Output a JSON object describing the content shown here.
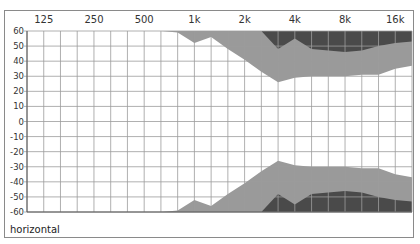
{
  "chart_data": {
    "type": "area",
    "title": "",
    "label": "horizontal",
    "xlabel": "Frequency (Hz)",
    "ylabel": "Angle (degrees)",
    "x_tick_labels": [
      "125",
      "250",
      "500",
      "1k",
      "2k",
      "4k",
      "8k",
      "16k"
    ],
    "y_tick_labels": [
      "60",
      "50",
      "40",
      "30",
      "20",
      "10",
      "0",
      "-10",
      "-20",
      "-30",
      "-40",
      "-50",
      "-60"
    ],
    "ylim": [
      -60,
      60
    ],
    "xscale": "log (1/3-octave grid)",
    "grid": true,
    "x_freqs": [
      "100",
      "125",
      "160",
      "200",
      "250",
      "315",
      "400",
      "500",
      "630",
      "800",
      "1k",
      "1.25k",
      "1.6k",
      "2k",
      "2.5k",
      "3.15k",
      "4k",
      "5k",
      "6.3k",
      "8k",
      "10k",
      "12.5k",
      "16k",
      "20k"
    ],
    "series": [
      {
        "name": "-6 dB contour (light gray, upper edge of open region)",
        "color": "#9a9a9a",
        "upper_positive": [
          60,
          60,
          60,
          60,
          60,
          60,
          60,
          60,
          60,
          59,
          52,
          56,
          48,
          41,
          33,
          26,
          29,
          30,
          30,
          30,
          31,
          31,
          35,
          37
        ],
        "lower_negative": [
          -60,
          -60,
          -60,
          -60,
          -60,
          -60,
          -60,
          -60,
          -60,
          -59,
          -52,
          -56,
          -48,
          -41,
          -33,
          -26,
          -29,
          -30,
          -30,
          -30,
          -31,
          -31,
          -35,
          -37
        ]
      },
      {
        "name": "-12 dB contour (dark gray)",
        "color": "#4a4a4a",
        "upper_positive": [
          60,
          60,
          60,
          60,
          60,
          60,
          60,
          60,
          60,
          60,
          60,
          60,
          60,
          60,
          60,
          48,
          55,
          48,
          47,
          46,
          47,
          50,
          52,
          53
        ],
        "lower_negative": [
          -60,
          -60,
          -60,
          -60,
          -60,
          -60,
          -60,
          -60,
          -60,
          -60,
          -60,
          -60,
          -60,
          -60,
          -60,
          -48,
          -55,
          -48,
          -47,
          -46,
          -47,
          -50,
          -52,
          -53
        ]
      }
    ],
    "legend": []
  },
  "colors": {
    "light_band": "#9a9a9a",
    "dark_band": "#4a4a4a",
    "grid": "#9c9c9c",
    "axis": "#555555",
    "background": "#ffffff"
  }
}
